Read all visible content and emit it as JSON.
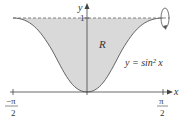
{
  "figure": {
    "curve_label": "y = sin² x",
    "region_label": "R",
    "x_axis_label": "x",
    "y_axis_label": "y",
    "y_tick_label": "1",
    "x_left_tick": {
      "numerator": "−π",
      "denominator": "2"
    },
    "x_right_tick": {
      "numerator": "π",
      "denominator": "2"
    },
    "colors": {
      "region_fill": "#d9d9d9",
      "curve": "#555555",
      "axes": "#444444",
      "dashed_line": "#777777"
    },
    "rotation_axis": "y = 1"
  }
}
